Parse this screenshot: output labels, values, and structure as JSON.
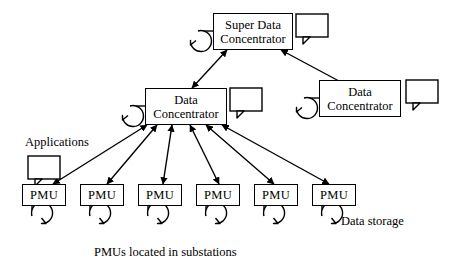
{
  "diagram": {
    "title": "PMUs located in substations",
    "stroke_color": "#000000",
    "background_color": "#ffffff",
    "nodes": {
      "super_concentrator": {
        "label_line1": "Super Data",
        "label_line2": "Concentrator"
      },
      "left_concentrator": {
        "label_line1": "Data",
        "label_line2": "Concentrator"
      },
      "right_concentrator": {
        "label_line1": "Data",
        "label_line2": "Concentrator"
      }
    },
    "pmus": [
      {
        "label": "PMU"
      },
      {
        "label": "PMU"
      },
      {
        "label": "PMU"
      },
      {
        "label": "PMU"
      },
      {
        "label": "PMU"
      },
      {
        "label": "PMU"
      }
    ],
    "annotations": {
      "applications": "Applications",
      "data_storage": "Data storage",
      "caption": "PMUs located in substations"
    },
    "icons": {
      "applications_bubble": "speech-bubble-icon",
      "data_storage": "data-storage-cylinder-icon",
      "arrow": "bidirectional-arrow-icon"
    }
  }
}
